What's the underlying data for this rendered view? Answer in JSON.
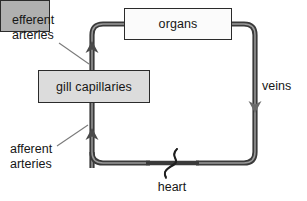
{
  "diagram": {
    "nodes": {
      "organs": {
        "label": "organs"
      },
      "gill_capillaries": {
        "label": "gill capillaries"
      },
      "heart": {
        "label": "heart"
      }
    },
    "labels": {
      "efferent_arteries": "efferent\narteries",
      "afferent_arteries": "afferent\narteries",
      "veins": "veins",
      "heart": "heart"
    },
    "colors": {
      "vessel": "#3a3a3a",
      "vessel_highlight": "#8c8c8c",
      "organs_fill": "#fbfbfb",
      "gill_fill": "#dcdcdc",
      "heart_fill": "#b0b0b0",
      "outline": "#2b2b2b",
      "text": "#161616",
      "leader_line": "#6e6e6e",
      "background": "#ffffff"
    },
    "flow_arrows": [
      {
        "name": "efferent-up-arrow",
        "direction": "up"
      },
      {
        "name": "afferent-up-arrow",
        "direction": "up"
      },
      {
        "name": "veins-down-arrow",
        "direction": "down"
      }
    ]
  }
}
